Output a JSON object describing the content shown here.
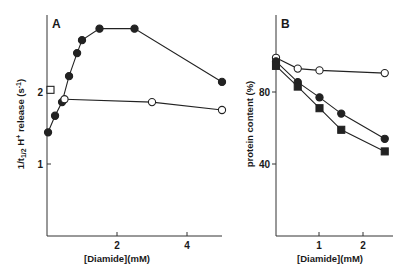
{
  "chart_data": [
    {
      "type": "line",
      "panel": "A",
      "title": "",
      "xlabel": "[Diamide](mM)",
      "ylabel": "1/t1/2 H+ release (s-1)",
      "xlim": [
        0,
        5
      ],
      "ylim": [
        0,
        3
      ],
      "x_ticks": [
        2,
        4
      ],
      "y_ticks": [
        1,
        2
      ],
      "grid": false,
      "legend": null,
      "series": [
        {
          "name": "filled circles",
          "marker": "filled-circle",
          "x": [
            0.03,
            0.23,
            0.43,
            0.63,
            0.86,
            1.0,
            1.5,
            2.5,
            5.0
          ],
          "y": [
            1.44,
            1.67,
            1.86,
            2.22,
            2.54,
            2.72,
            2.88,
            2.88,
            2.14
          ]
        },
        {
          "name": "open circles",
          "marker": "open-circle",
          "x": [
            0.5,
            3.0,
            5.0
          ],
          "y": [
            1.9,
            1.86,
            1.75
          ]
        },
        {
          "name": "open square",
          "marker": "open-square",
          "x": [
            0.1
          ],
          "y": [
            2.03
          ]
        }
      ]
    },
    {
      "type": "line",
      "panel": "B",
      "title": "",
      "xlabel": "[Diamide](mM)",
      "ylabel": "protein content (%)",
      "xlim": [
        0,
        2.7
      ],
      "ylim": [
        0,
        100
      ],
      "x_ticks": [
        1,
        2
      ],
      "y_ticks": [
        40,
        80
      ],
      "grid": false,
      "legend": null,
      "series": [
        {
          "name": "open circles",
          "marker": "open-circle",
          "x": [
            0,
            0.5,
            1.0,
            2.5
          ],
          "y": [
            99,
            93,
            92,
            90.5
          ]
        },
        {
          "name": "filled circles",
          "marker": "filled-circle",
          "x": [
            0,
            0.5,
            1.0,
            1.5,
            2.5
          ],
          "y": [
            97,
            85.5,
            77,
            68,
            54
          ]
        },
        {
          "name": "filled squares",
          "marker": "filled-square",
          "x": [
            0,
            0.5,
            1.0,
            1.5,
            2.5
          ],
          "y": [
            94.5,
            83,
            71,
            59,
            47
          ]
        }
      ]
    }
  ],
  "panels": {
    "a": {
      "letter": "A",
      "ylabel_main": "1/t",
      "ylabel_sub": "1/2",
      "ylabel_mid": " H",
      "ylabel_sup": "+",
      "ylabel_rest": " release (s",
      "ylabel_sup2": "-1",
      "ylabel_end": ")",
      "xlabel": "[Diamide](mM)",
      "ytick_labels": [
        "1",
        "2"
      ],
      "xtick_labels": [
        "2",
        "4"
      ]
    },
    "b": {
      "letter": "B",
      "ylabel": "protein content (%)",
      "xlabel": "[Diamide](mM)",
      "ytick_labels": [
        "40",
        "80"
      ],
      "xtick_labels": [
        "1",
        "2"
      ]
    }
  },
  "colors": {
    "ink": "#222222",
    "background": "#ffffff"
  }
}
